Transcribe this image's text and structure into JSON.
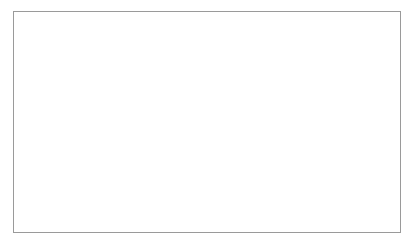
{
  "chart_data": {
    "type": "line",
    "title": "",
    "xlabel": "(년도)",
    "ylabel": "인 수 (억)",
    "ylabel_chars": [
      "인",
      "수",
      "(억)"
    ],
    "ylim": [
      0.0,
      3.5
    ],
    "yticks": [
      "0.0",
      "0.5",
      "1.0",
      "1.5",
      "2.0",
      "2.5",
      "3.0",
      "3.5"
    ],
    "ytick_values": [
      0.0,
      0.5,
      1.0,
      1.5,
      2.0,
      2.5,
      3.0,
      3.5
    ],
    "grid": true,
    "legend": "none",
    "xtick_labels": [
      "2010",
      "2012",
      "2014",
      "2016",
      "2018",
      "2020",
      "2022",
      "2024",
      "2026",
      "2028",
      "2030",
      "2032",
      "2034",
      "2036",
      "2038",
      "2040",
      "2042",
      "2044",
      "2046",
      "2048",
      "2050"
    ],
    "xtick_rotation": 90,
    "marker": "circle",
    "x": [
      2010,
      2011,
      2012,
      2013,
      2014,
      2015,
      2016,
      2017,
      2018,
      2019,
      2020,
      2021,
      2022,
      2023,
      2024,
      2025,
      2026,
      2027,
      2028,
      2029,
      2030,
      2031,
      2032,
      2033,
      2034,
      2035,
      2036,
      2037,
      2038,
      2039,
      2040,
      2041,
      2042,
      2043,
      2044,
      2045,
      2046,
      2047,
      2048,
      2049,
      2050
    ],
    "values": [
      1.2,
      1.22,
      1.24,
      1.26,
      1.29,
      1.33,
      1.4,
      1.46,
      1.53,
      1.59,
      1.65,
      1.71,
      1.76,
      1.81,
      1.86,
      1.91,
      1.97,
      2.05,
      2.14,
      2.24,
      2.35,
      2.47,
      2.58,
      2.68,
      2.77,
      2.85,
      2.92,
      2.98,
      3.03,
      3.07,
      3.1,
      3.12,
      3.13,
      3.13,
      3.13,
      3.13,
      3.13,
      3.14,
      3.14,
      3.14,
      3.15
    ],
    "series": [
      {
        "name": "인구수",
        "values": [
          1.2,
          1.22,
          1.24,
          1.26,
          1.29,
          1.33,
          1.4,
          1.46,
          1.53,
          1.59,
          1.65,
          1.71,
          1.76,
          1.81,
          1.86,
          1.91,
          1.97,
          2.05,
          2.14,
          2.24,
          2.35,
          2.47,
          2.58,
          2.68,
          2.77,
          2.85,
          2.92,
          2.98,
          3.03,
          3.07,
          3.1,
          3.12,
          3.13,
          3.13,
          3.13,
          3.13,
          3.13,
          3.14,
          3.14,
          3.14,
          3.15
        ]
      }
    ],
    "colors": {
      "line": "#111111",
      "marker": "#111111",
      "grid": "#808080",
      "axis": "#1a1a1a",
      "frame": "#9a9a9a",
      "background": "#ffffff"
    }
  }
}
